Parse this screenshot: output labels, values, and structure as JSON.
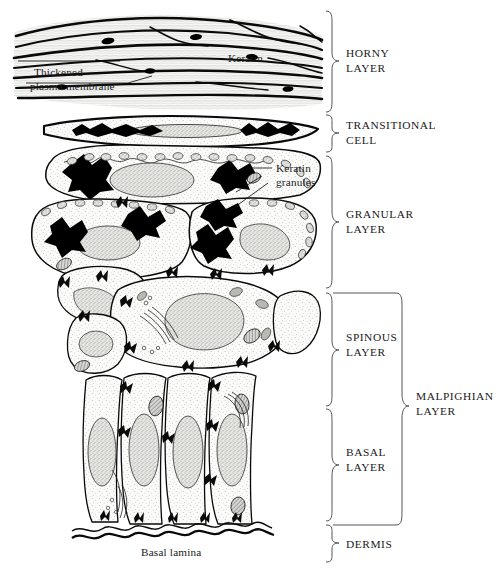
{
  "figure": {
    "background": "#ffffff",
    "ink": "#111111",
    "brace_color": "#555555",
    "cytoplasm_fill": "#f0f0ee",
    "nucleus_fill": "#d8d8d4",
    "granule_fill": "#000000"
  },
  "layer_labels": [
    {
      "id": "horny",
      "line1": "HORNY",
      "line2": "LAYER"
    },
    {
      "id": "transitional",
      "line1": "TRANSITIONAL",
      "line2": "CELL"
    },
    {
      "id": "granular",
      "line1": "GRANULAR",
      "line2": "LAYER"
    },
    {
      "id": "spinous",
      "line1": "SPINOUS",
      "line2": "LAYER"
    },
    {
      "id": "basal",
      "line1": "BASAL",
      "line2": "LAYER"
    },
    {
      "id": "dermis",
      "line1": "DERMIS",
      "line2": ""
    },
    {
      "id": "malpighian",
      "line1": "MALPIGHIAN",
      "line2": "LAYER"
    }
  ],
  "annotations": {
    "keratin": "Keratin",
    "thickened_membrane_line1": "Thickened",
    "thickened_membrane_line2": "plasma membrane",
    "keratin_granules_line1": "Keratin",
    "keratin_granules_line2": "granules",
    "basal_lamina": "Basal lamina"
  }
}
